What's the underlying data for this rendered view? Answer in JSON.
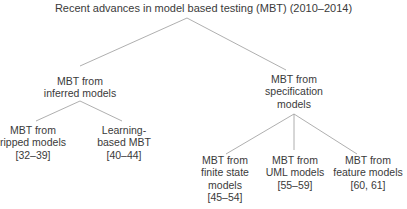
{
  "root": {
    "label": "Recent advances in model based testing (MBT) (2010–2014)"
  },
  "inferred": {
    "lines": [
      "MBT from",
      "inferred models"
    ],
    "children": [
      {
        "lines": [
          "MBT from",
          "ripped models",
          "[32–39]"
        ]
      },
      {
        "lines": [
          "Learning-",
          "based MBT",
          "[40–44]"
        ]
      }
    ]
  },
  "specification": {
    "lines": [
      "MBT from",
      "specification",
      "models"
    ],
    "children": [
      {
        "lines": [
          "MBT from",
          "finite state",
          "models",
          "[45–54]"
        ]
      },
      {
        "lines": [
          "MBT from",
          "UML models",
          "[55–59]"
        ]
      },
      {
        "lines": [
          "MBT from",
          "feature models",
          "[60, 61]"
        ]
      }
    ]
  },
  "colors": {
    "text": "#3a3a3a",
    "edge": "#9a9a9a",
    "background": "#ffffff"
  }
}
